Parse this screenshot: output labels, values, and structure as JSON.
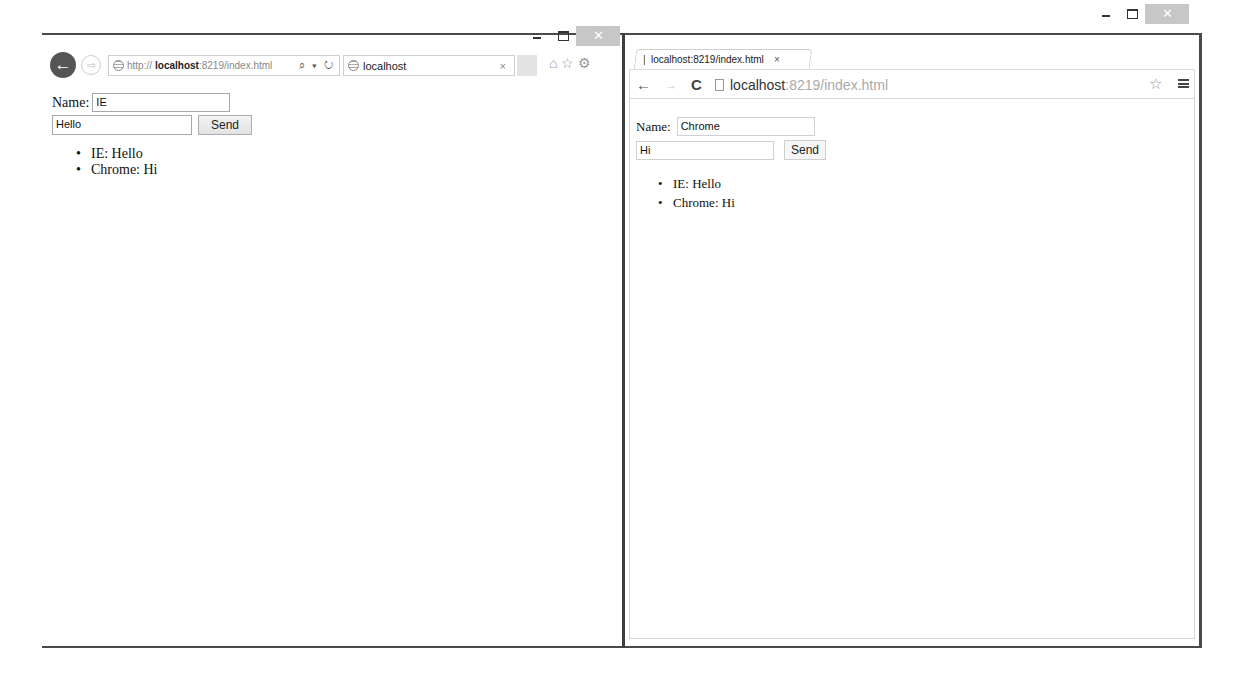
{
  "ie_window": {
    "controls": {
      "minimize": "–",
      "maximize": "□",
      "close": "✕"
    },
    "nav": {
      "back_icon": "←",
      "forward_icon": "⇨"
    },
    "address": {
      "prefix": "http://",
      "host": "localhost",
      "rest": ":8219/index.html",
      "tools": "⌕ ▾ ↻"
    },
    "tab": {
      "title": "localhost",
      "close": "×"
    },
    "toolbar_icons": "⌂☆⚙",
    "page": {
      "name_label": "Name:",
      "name_value": "IE",
      "message_value": "Hello",
      "send_label": "Send",
      "messages": [
        "IE: Hello",
        "Chrome: Hi"
      ]
    }
  },
  "chrome_window": {
    "controls": {
      "minimize": "–",
      "maximize": "□",
      "close": "✕"
    },
    "tab": {
      "title": "localhost:8219/index.html",
      "close": "×"
    },
    "nav": {
      "back_icon": "←",
      "forward_icon": "→",
      "reload_icon": "C"
    },
    "omnibox": {
      "host": "localhost",
      "rest": ":8219/index.html"
    },
    "star_icon": "☆",
    "page": {
      "name_label": "Name:",
      "name_value": "Chrome",
      "message_value": "Hi",
      "send_label": "Send",
      "messages": [
        "IE: Hello",
        "Chrome: Hi"
      ]
    }
  }
}
